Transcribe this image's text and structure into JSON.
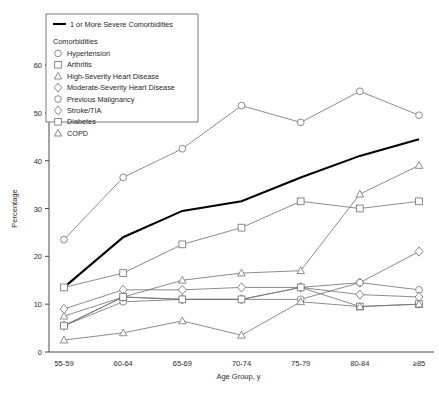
{
  "chart_data": {
    "type": "line",
    "title": "",
    "xlabel": "Age Group, y",
    "ylabel": "Percentage",
    "categories": [
      "55-59",
      "60-64",
      "65-69",
      "70-74",
      "75-79",
      "80-84",
      "≥85"
    ],
    "ylim": [
      0,
      60
    ],
    "yticks": [
      0,
      10,
      20,
      30,
      40,
      50,
      60
    ],
    "grid": false,
    "legend_position": "top-left",
    "legend_title": "Comorbidities",
    "highlight_series_label": "1 or More Severe Comorbidities",
    "series": [
      {
        "name": "1 or More Severe Comorbidities",
        "marker": "none",
        "style": "thick",
        "values": [
          13.5,
          24.0,
          29.5,
          31.5,
          36.5,
          41.0,
          44.5
        ]
      },
      {
        "name": "Hypertension",
        "marker": "circle",
        "values": [
          23.5,
          36.5,
          42.5,
          51.5,
          48.0,
          54.5,
          49.5
        ]
      },
      {
        "name": "Arthritis",
        "marker": "square",
        "values": [
          13.5,
          16.5,
          22.5,
          26.0,
          31.5,
          30.0,
          31.5
        ]
      },
      {
        "name": "High-Severity Heart Disease",
        "marker": "triangle",
        "values": [
          7.5,
          11.5,
          15.0,
          16.5,
          17.0,
          33.0,
          39.0
        ]
      },
      {
        "name": "Moderate-Severity Heart Disease",
        "marker": "diamond",
        "values": [
          9.0,
          13.0,
          13.0,
          13.5,
          13.5,
          14.5,
          21.0
        ]
      },
      {
        "name": "Previous Malignancy",
        "marker": "circle",
        "values": [
          5.5,
          10.5,
          11.0,
          11.0,
          11.0,
          14.5,
          13.0
        ]
      },
      {
        "name": "Stroke/TIA",
        "marker": "diamond",
        "values": [
          5.5,
          11.5,
          11.0,
          11.0,
          13.5,
          12.0,
          11.5
        ]
      },
      {
        "name": "Diabetes",
        "marker": "square",
        "values": [
          5.5,
          11.5,
          11.0,
          11.0,
          13.5,
          9.5,
          10.0
        ]
      },
      {
        "name": "COPD",
        "marker": "triangle",
        "values": [
          2.5,
          4.0,
          6.5,
          3.5,
          10.5,
          9.5,
          10.0
        ]
      }
    ],
    "legend_entries": [
      {
        "label": "1 or More Severe Comorbidities",
        "marker": "line"
      },
      {
        "label": "Hypertension",
        "marker": "circle"
      },
      {
        "label": "Arthritis",
        "marker": "square"
      },
      {
        "label": "High-Severity Heart Disease",
        "marker": "triangle"
      },
      {
        "label": "Moderate-Severity Heart Disease",
        "marker": "diamond"
      },
      {
        "label": "Previous Malignancy",
        "marker": "circle"
      },
      {
        "label": "Stroke/TIA",
        "marker": "diamond"
      },
      {
        "label": "Diabetes",
        "marker": "square"
      },
      {
        "label": "COPD",
        "marker": "triangle"
      }
    ],
    "colors": {
      "line": "#6e6e6e",
      "highlight": "#000000",
      "axis": "#4a4a4a",
      "background": "#ffffff"
    }
  }
}
